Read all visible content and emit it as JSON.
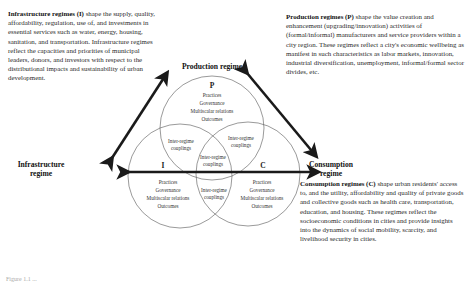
{
  "regimes": {
    "infrastructure": {
      "label": "Infrastructure regime",
      "label_line1": "Infrastructure",
      "label_line2": "regime",
      "letter": "I",
      "desc_bold": "Infrastructure regimes (I)",
      "desc_rest": " shape the supply, quality, affordability, regulation, use of, and investments in essential services such as water, energy, housing, sanitation, and transportation. Infrastructure regimes reflect the capacities and priorities of municipal leaders, donors, and investors with respect to the distributional impacts and sustainability of urban development."
    },
    "production": {
      "label": "Production regime",
      "letter": "P",
      "desc_bold": "Production regimes (P)",
      "desc_rest": " shape the value creation and enhancement (upgrading/innovation) activities of (formal/informal) manufacturers and service providers within a city region.  These regimes reflect a city's economic wellbeing as manifest in such characteristics as labor markets, innovation, industrial diversification, unemployment, informal/formal sector divides, etc."
    },
    "consumption": {
      "label": "Consumption regime",
      "label_line1": "Consumption",
      "label_line2": "regime",
      "letter": "C",
      "desc_bold": "Consumption regimes (C)",
      "desc_rest": " shape urban residents' access to, and the utility, affordability and quality of private goods and collective goods such as health care, transportation, education, and housing. These regimes reflect the socioeconomic conditions in cities and provide insights into the dynamics of social mobility, scarcity, and livelihood security in cities."
    }
  },
  "circle_contents": {
    "line1": "Practices",
    "line2": "Governance",
    "line3": "Multiscalar relations",
    "line4": "Outcomes"
  },
  "overlap": {
    "line1": "Inter-regime",
    "line2": "couplings"
  },
  "caption_partial": "Figure 1.1 ..."
}
